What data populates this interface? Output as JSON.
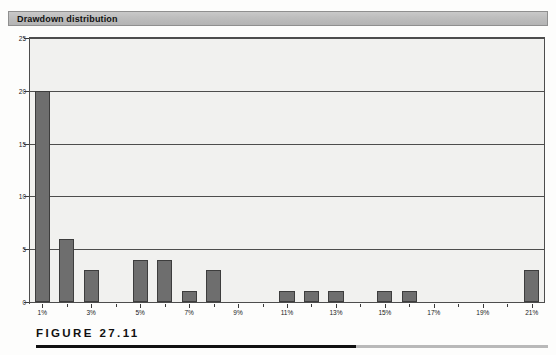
{
  "panel": {
    "title": "Drawdown distribution"
  },
  "figure": {
    "caption": "FIGURE 27.11"
  },
  "chart_data": {
    "type": "bar",
    "title": "Drawdown distribution",
    "xlabel": "",
    "ylabel": "",
    "ylim": [
      0,
      25
    ],
    "yticks": [
      0,
      5,
      10,
      15,
      20,
      25
    ],
    "grid": true,
    "legend": null,
    "categories": [
      "1%",
      "2%",
      "3%",
      "4%",
      "5%",
      "6%",
      "7%",
      "8%",
      "9%",
      "10%",
      "11%",
      "12%",
      "13%",
      "14%",
      "15%",
      "16%",
      "17%",
      "18%",
      "19%",
      "20%",
      "21%"
    ],
    "values": [
      20,
      6,
      3,
      0,
      4,
      4,
      1,
      3,
      0,
      0,
      1,
      1,
      1,
      0,
      1,
      1,
      0,
      0,
      0,
      0,
      3
    ],
    "xtick_labels": [
      "1%",
      "3%",
      "5%",
      "7%",
      "9%",
      "11%",
      "13%",
      "15%",
      "17%",
      "19%",
      "21%"
    ],
    "xtick_categories": [
      0,
      2,
      4,
      6,
      8,
      10,
      12,
      14,
      16,
      18,
      20
    ],
    "colors": {
      "bar_fill": "#6e6e6e",
      "bar_border": "#3d3d3d",
      "plot_bg": "#f1f1ef",
      "axis": "#4d4d4d",
      "header_bg": "#bdbdbd",
      "text": "#1a1a1a"
    }
  }
}
